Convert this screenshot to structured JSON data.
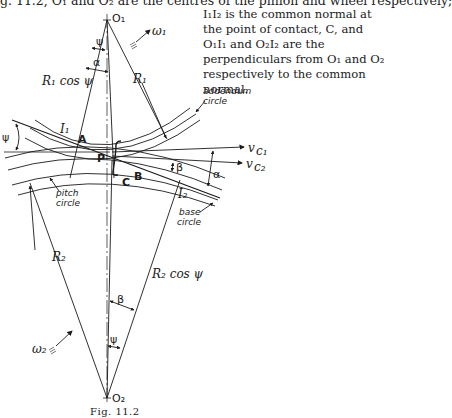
{
  "text": {
    "top_line_cut": "g. 11.2, O₁ and O₂ are the centres of the pinion and wheel respectively;",
    "paragraph": "I₁I₂ is the common normal at the point of contact, C, and O₁I₁ and O₂I₂ are the perpendiculars from O₁ and O₂ respectively to the common normal."
  },
  "figure": {
    "caption": "Fig. 11.2",
    "labels": {
      "o1": "O₁",
      "o2": "O₂",
      "omega1": "ω₁",
      "omega2": "ω₂",
      "r1": "R₁",
      "r2": "R₂",
      "r1cos": "R₁ cos ψ",
      "r2cos": "R₂ cos ψ",
      "psi_top": "ψ",
      "alpha_top": "α",
      "psi_left": "ψ",
      "i1": "I₁",
      "i2": "I₂",
      "a": "A",
      "b": "B",
      "c": "C",
      "p": "P",
      "beta_mid": "β",
      "alpha_right": "α",
      "vc1": "v",
      "vc1_sub": "c₁",
      "vc2": "v",
      "vc2_sub": "c₂",
      "addendum1": "addendum",
      "addendum2": "circle",
      "pitch1": "pitch",
      "pitch2": "circle",
      "base1": "base",
      "base2": "circle",
      "beta_bottom": "β",
      "psi_bottom": "ψ"
    }
  }
}
